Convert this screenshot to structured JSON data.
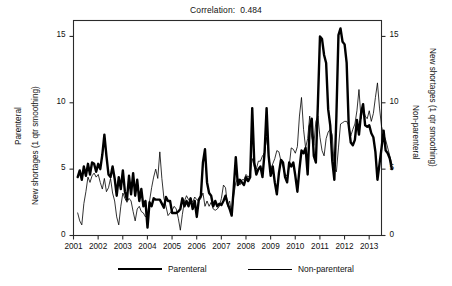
{
  "chart_data": {
    "type": "line",
    "title": "Correlation:  0.484",
    "xlabel": "",
    "ylabel": "New shortages (1 qtr smoothing)",
    "xlim": [
      2001.0,
      2013.5
    ],
    "ylim": [
      0,
      16.2
    ],
    "grid": false,
    "legend_position": "bottom",
    "axes": {
      "left": {
        "outer_title": "Parenteral",
        "inner_title": "New shortages (1 qtr smoothing)",
        "ticks": [
          0,
          5,
          10,
          15
        ],
        "tick_labels": [
          "0",
          "5",
          "10",
          "15"
        ]
      },
      "right": {
        "inner_title": "Non-parenteral",
        "outer_title": "New shortages (1 qtr smoothing)",
        "ticks": [
          0,
          5,
          10,
          15
        ],
        "tick_labels": [
          "0",
          "5",
          "10",
          "15"
        ]
      },
      "x": {
        "ticks": [
          2001,
          2002,
          2003,
          2004,
          2005,
          2006,
          2007,
          2008,
          2009,
          2010,
          2011,
          2012,
          2013
        ],
        "tick_labels": [
          "2001",
          "2002",
          "2003",
          "2004",
          "2005",
          "2006",
          "2007",
          "2008",
          "2009",
          "2010",
          "2011",
          "2012",
          "2013"
        ]
      }
    },
    "x_start": 2001.17,
    "x_step": 0.08333,
    "series": [
      {
        "name": "Parenteral",
        "style": "thick",
        "color": "#000000",
        "linewidth": 2.4,
        "values": [
          4.4,
          4.9,
          4.2,
          5.2,
          4.5,
          5.4,
          4.6,
          5.5,
          5.4,
          4.8,
          5.4,
          5.0,
          6.1,
          7.6,
          6.0,
          4.6,
          4.4,
          5.2,
          4.3,
          3.0,
          4.4,
          3.5,
          4.9,
          3.3,
          2.7,
          4.5,
          3.1,
          4.7,
          3.0,
          4.2,
          2.6,
          3.5,
          2.2,
          2.6,
          0.6,
          2.5,
          2.2,
          2.8,
          2.7,
          2.7,
          2.7,
          2.4,
          2.1,
          2.9,
          2.6,
          2.6,
          1.7,
          1.7,
          1.7,
          1.8,
          2.0,
          2.8,
          2.2,
          2.6,
          2.2,
          2.8,
          2.0,
          2.6,
          1.4,
          2.7,
          3.0,
          5.5,
          6.5,
          4.0,
          3.2,
          3.0,
          2.2,
          2.6,
          2.2,
          2.4,
          2.3,
          2.6,
          3.0,
          2.4,
          2.0,
          1.5,
          3.6,
          5.9,
          3.8,
          4.2,
          4.0,
          3.8,
          4.4,
          4.1,
          4.4,
          9.6,
          5.5,
          4.6,
          5.0,
          5.2,
          4.4,
          6.2,
          9.6,
          6.0,
          4.5,
          5.2,
          4.0,
          3.1,
          4.7,
          5.7,
          5.5,
          4.4,
          4.0,
          5.5,
          5.2,
          5.5,
          4.5,
          3.3,
          5.0,
          6.4,
          6.2,
          6.6,
          4.6,
          8.2,
          8.8,
          6.0,
          5.5,
          10.0,
          15.0,
          14.8,
          13.6,
          13.0,
          9.5,
          8.3,
          5.6,
          4.2,
          9.0,
          15.1,
          15.6,
          14.6,
          14.4,
          13.0,
          8.3,
          7.0,
          6.8,
          7.2,
          8.7,
          7.6,
          9.2,
          9.9,
          8.3,
          8.2,
          8.3,
          7.7,
          7.4,
          6.3,
          4.2,
          5.4,
          6.6,
          7.9,
          6.4,
          6.2,
          5.8,
          5.0
        ]
      },
      {
        "name": "Non-parenteral",
        "style": "thin",
        "color": "#000000",
        "linewidth": 0.8,
        "values": [
          1.7,
          1.1,
          0.8,
          2.4,
          3.3,
          4.4,
          4.0,
          4.5,
          4.7,
          4.4,
          4.6,
          4.0,
          3.5,
          4.3,
          3.3,
          3.6,
          4.3,
          3.2,
          2.6,
          1.4,
          0.8,
          2.2,
          3.2,
          2.8,
          2.5,
          2.8,
          2.6,
          1.8,
          1.1,
          2.0,
          2.2,
          1.8,
          1.7,
          1.4,
          1.6,
          2.6,
          3.6,
          4.4,
          5.0,
          4.3,
          6.3,
          4.3,
          2.8,
          2.2,
          1.5,
          1.7,
          1.9,
          2.2,
          2.0,
          1.3,
          0.4,
          1.6,
          2.6,
          3.0,
          2.7,
          2.8,
          2.5,
          2.9,
          2.7,
          2.6,
          2.8,
          3.2,
          2.2,
          2.6,
          2.2,
          2.5,
          2.0,
          1.9,
          2.0,
          2.2,
          2.8,
          3.8,
          3.6,
          2.2,
          2.6,
          1.6,
          3.0,
          4.0,
          4.3,
          3.8,
          4.2,
          4.2,
          4.6,
          4.4,
          4.6,
          5.8,
          5.2,
          5.0,
          5.6,
          5.6,
          6.0,
          6.2,
          7.4,
          6.0,
          5.0,
          5.4,
          5.8,
          6.4,
          6.3,
          5.6,
          5.2,
          4.6,
          4.5,
          5.2,
          6.6,
          6.5,
          6.2,
          6.7,
          9.0,
          10.4,
          8.0,
          6.6,
          7.3,
          9.0,
          7.4,
          6.8,
          8.6,
          9.0,
          7.4,
          6.4,
          6.0,
          7.3,
          7.8,
          8.0,
          7.6,
          5.0,
          4.8,
          6.6,
          8.4,
          8.5,
          8.6,
          8.6,
          8.3,
          7.5,
          8.0,
          8.4,
          9.4,
          11.0,
          8.8,
          9.6,
          9.0,
          8.8,
          9.4,
          8.6,
          9.2,
          10.4,
          11.5,
          9.6,
          8.2,
          7.6,
          7.2,
          6.6,
          6.0,
          5.4
        ]
      }
    ]
  },
  "legend": {
    "items": [
      {
        "label": "Parenteral",
        "style": "thick"
      },
      {
        "label": "Non-parenteral",
        "style": "thin"
      }
    ]
  }
}
